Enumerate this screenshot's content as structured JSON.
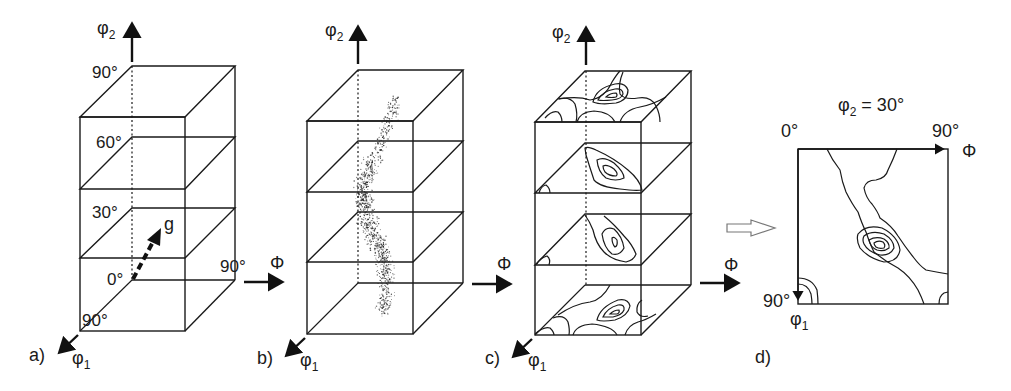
{
  "figure": {
    "panels": [
      {
        "id": "a",
        "label": "a)",
        "axis_vertical": "φ",
        "axis_vertical_sub": "2",
        "axis_horizontal": "Φ",
        "axis_depth": "φ",
        "axis_depth_sub": "1",
        "phi2_ticks": [
          "90°",
          "60°",
          "30°",
          "0°"
        ],
        "phi_tick": "90°",
        "phi1_tick": "90°",
        "vector_label": "g"
      },
      {
        "id": "b",
        "label": "b)",
        "axis_vertical": "φ",
        "axis_vertical_sub": "2",
        "axis_horizontal": "Φ",
        "axis_depth": "φ",
        "axis_depth_sub": "1",
        "content": "scatter of individual orientations"
      },
      {
        "id": "c",
        "label": "c)",
        "axis_vertical": "φ",
        "axis_vertical_sub": "2",
        "axis_horizontal": "Φ",
        "axis_depth": "φ",
        "axis_depth_sub": "1",
        "content": "ODF contour sections"
      },
      {
        "id": "d",
        "label": "d)",
        "title_var": "φ",
        "title_sub": "2",
        "title_rest": " = 30°",
        "origin_tick": "0°",
        "phi_tick": "90°",
        "axis_horizontal": "Φ",
        "phi1_tick": "90°",
        "axis_depth": "φ",
        "axis_depth_sub": "1",
        "content": "single φ2 = 30° section with contours"
      }
    ],
    "colors": {
      "line": "#1a1a1a",
      "background": "#ffffff"
    }
  }
}
